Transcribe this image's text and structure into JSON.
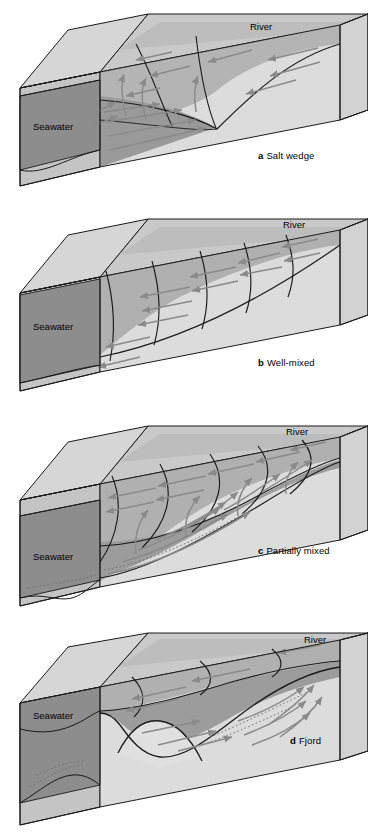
{
  "figure": {
    "type": "scientific-diagram",
    "background": "#ffffff",
    "palette": {
      "top_face": "#c9c9c9",
      "top_face_light": "#d6d6d6",
      "front_face_light": "#dcdcdc",
      "front_face_lighter": "#e4e4e4",
      "seawater_dark": "#8d8d8d",
      "water_mid": "#a8a8a8",
      "water_mid2": "#b4b4b4",
      "outline": "#1a1a1a",
      "arrow": "#8a8a8a",
      "isohaline": "#1a1a1a",
      "sediment_dot": "#6f6f6f"
    },
    "panels": [
      {
        "id": "a",
        "letter": "a",
        "caption": "Salt wedge",
        "seawater_label": "Seawater",
        "river_label": "River",
        "description": "Sharp salt wedge tapering landward; strong two-layer flow",
        "arrow_count_surface": 7,
        "arrow_count_bottom": 6,
        "isohaline_count": 3
      },
      {
        "id": "b",
        "letter": "b",
        "caption": "Well-mixed",
        "seawater_label": "Seawater",
        "river_label": "River",
        "description": "Near-vertical isohalines, uniform seaward flow at all depths",
        "arrow_count_surface": 6,
        "arrow_count_bottom": 6,
        "isohaline_count": 5
      },
      {
        "id": "c",
        "letter": "c",
        "caption": "Partially mixed",
        "seawater_label": "Seawater",
        "river_label": "River",
        "description": "Tilted isohalines with seaward surface flow and landward bottom flow",
        "arrow_count_surface": 7,
        "arrow_count_bottom": 7,
        "isohaline_count": 5
      },
      {
        "id": "d",
        "letter": "d",
        "caption": "Fjord",
        "seawater_label": "Seawater",
        "river_label": "River",
        "description": "Deep basin with shallow sill restricting exchange of bottom water",
        "arrow_count_surface": 4,
        "arrow_count_bottom": 8,
        "isohaline_count": 3,
        "has_sill": true
      }
    ]
  }
}
